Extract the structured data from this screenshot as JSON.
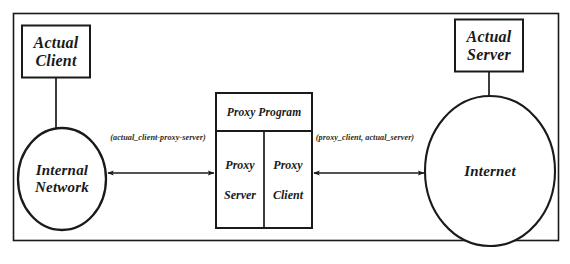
{
  "diagram": {
    "frame": {
      "name": "outer-frame"
    },
    "stroke_color": "#1a1a1a",
    "background_color": "#ffffff",
    "nodes": {
      "actual_client": {
        "label_line1": "Actual",
        "label_line2": "Client",
        "shape": "rectangle"
      },
      "actual_server": {
        "label_line1": "Actual",
        "label_line2": "Server",
        "shape": "rectangle"
      },
      "internal_network": {
        "label_line1": "Internal",
        "label_line2": "Network",
        "shape": "ellipse"
      },
      "internet": {
        "label_line1": "Internet",
        "label_line2": "",
        "shape": "ellipse"
      },
      "proxy_program": {
        "header": "Proxy Program",
        "left_pane_line1": "Proxy",
        "left_pane_line2": "Server",
        "right_pane_line1": "Proxy",
        "right_pane_line2": "Client",
        "shape": "rectangle"
      }
    },
    "edges": [
      {
        "name": "client-side-connection",
        "label": "(actual_client-proxy-server)",
        "from": "internal_network",
        "to": "proxy_server",
        "arrows": "both"
      },
      {
        "name": "server-side-connection",
        "label": "(proxy_client, actual_server)",
        "from": "proxy_client",
        "to": "internet",
        "arrows": "both"
      }
    ],
    "connectors": [
      {
        "name": "client-to-network-link",
        "from": "actual_client",
        "to": "internal_network"
      },
      {
        "name": "server-to-internet-link",
        "from": "actual_server",
        "to": "internet"
      }
    ]
  }
}
